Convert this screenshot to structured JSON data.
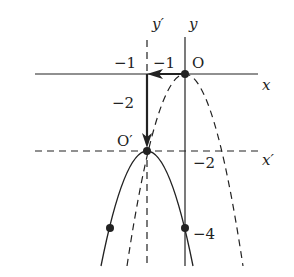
{
  "diagram": {
    "type": "parabola-translation",
    "axes": {
      "x_label": "x",
      "y_label": "y",
      "x_prime_label": "x′",
      "y_prime_label": "y′",
      "origin_label": "O",
      "origin_prime_label": "O′"
    },
    "tick_labels": {
      "x_minus1_top_left": "−1",
      "x_minus1_top_right": "−1",
      "shift_down": "−2",
      "y_minus2": "−2",
      "y_minus4": "−4"
    },
    "curves": [
      {
        "name": "original",
        "equation": "y = -2x^2",
        "style": "dashed",
        "vertex": [
          0,
          0
        ]
      },
      {
        "name": "translated",
        "equation": "y = -2(x+1)^2 - 2",
        "style": "solid",
        "vertex": [
          -1,
          -2
        ]
      }
    ],
    "translation_vector": {
      "dx": -1,
      "dy": -2
    },
    "points": [
      {
        "label": "O",
        "x": 0,
        "y": 0
      },
      {
        "label": "O′",
        "x": -1,
        "y": -2
      },
      {
        "label": "",
        "x": 0,
        "y": -4
      },
      {
        "label": "",
        "x": -2,
        "y": -4
      }
    ],
    "colors": {
      "ink": "#222222",
      "background": "#ffffff"
    }
  }
}
